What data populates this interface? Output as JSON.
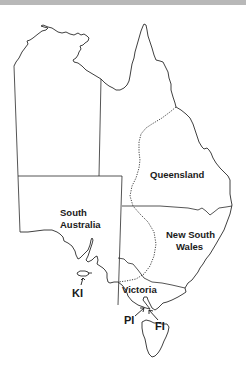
{
  "map": {
    "title": "Outline map of eastern Australia",
    "regions": [
      {
        "id": "queensland",
        "label": "Queensland"
      },
      {
        "id": "south-australia",
        "label_line1": "South",
        "label_line2": "Australia"
      },
      {
        "id": "new-south-wales",
        "label_line1": "New South",
        "label_line2": "Wales"
      },
      {
        "id": "victoria",
        "label": "Victoria"
      }
    ],
    "islands": [
      {
        "id": "kangaroo-island",
        "abbr": "KI"
      },
      {
        "id": "phillip-island",
        "abbr": "PI"
      },
      {
        "id": "french-island",
        "abbr": "FI"
      }
    ],
    "colors": {
      "line": "#2a2a2a",
      "background": "#ffffff",
      "top_band": "#b8b8b8"
    }
  }
}
